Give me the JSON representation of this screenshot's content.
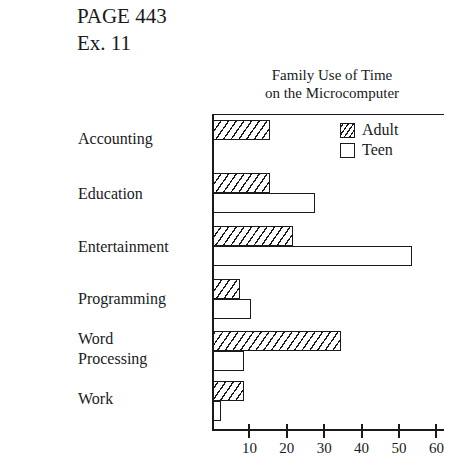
{
  "page": {
    "header_line1": "PAGE 443",
    "header_line2": "Ex. 11"
  },
  "chart_data": {
    "type": "bar",
    "orientation": "horizontal",
    "title": "Family Use of Time on the Microcomputer",
    "title_lines": [
      "Family Use of Time",
      "on the Microcomputer"
    ],
    "categories": [
      "Accounting",
      "Education",
      "Entertainment",
      "Programming",
      "Word Processing",
      "Work"
    ],
    "category_label_lines": [
      [
        "Accounting"
      ],
      [
        "Education"
      ],
      [
        "Entertainment"
      ],
      [
        "Programming"
      ],
      [
        "Word",
        "Processing"
      ],
      [
        "Work"
      ]
    ],
    "series": [
      {
        "name": "Adult",
        "pattern": "hatched",
        "values": [
          15,
          15,
          21,
          7,
          34,
          8
        ]
      },
      {
        "name": "Teen",
        "pattern": "open",
        "values": [
          0,
          27,
          53,
          10,
          8,
          2
        ]
      }
    ],
    "xlabel": "",
    "ylabel": "",
    "xlim": [
      0,
      60
    ],
    "xticks": [
      10,
      20,
      30,
      40,
      50,
      60
    ],
    "xtick_labels": [
      "10",
      "20",
      "30",
      "40",
      "50",
      "60"
    ],
    "grid": false,
    "legend": {
      "position": "upper right",
      "entries": [
        "Adult",
        "Teen"
      ]
    },
    "colors": {
      "ink": "#1a1a1a",
      "background": "#ffffff"
    }
  }
}
